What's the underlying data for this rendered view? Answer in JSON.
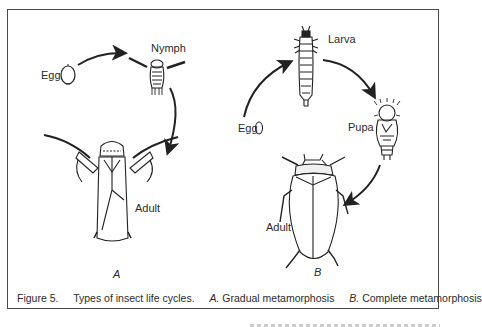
{
  "figure": {
    "caption": {
      "number": "Figure 5.",
      "title": "Types of insect life cycles.",
      "part_a_letter": "A.",
      "part_a_text": "Gradual metamorphosis",
      "part_b_letter": "B.",
      "part_b_text": "Complete metamorphosis"
    },
    "panel_a": {
      "letter": "A",
      "stages": [
        {
          "label": "Egg",
          "icon": "egg-icon"
        },
        {
          "label": "Nymph",
          "icon": "nymph-icon"
        },
        {
          "label": "Adult",
          "icon": "adult-bug-icon"
        }
      ]
    },
    "panel_b": {
      "letter": "B",
      "stages": [
        {
          "label": "Egg",
          "icon": "egg-icon"
        },
        {
          "label": "Larva",
          "icon": "larva-icon"
        },
        {
          "label": "Pupa",
          "icon": "pupa-icon"
        },
        {
          "label": "Adult",
          "icon": "beetle-icon"
        }
      ]
    },
    "colors": {
      "ink": "#2b2b2b",
      "frame": "#4a4a4a",
      "background": "#ffffff"
    }
  }
}
